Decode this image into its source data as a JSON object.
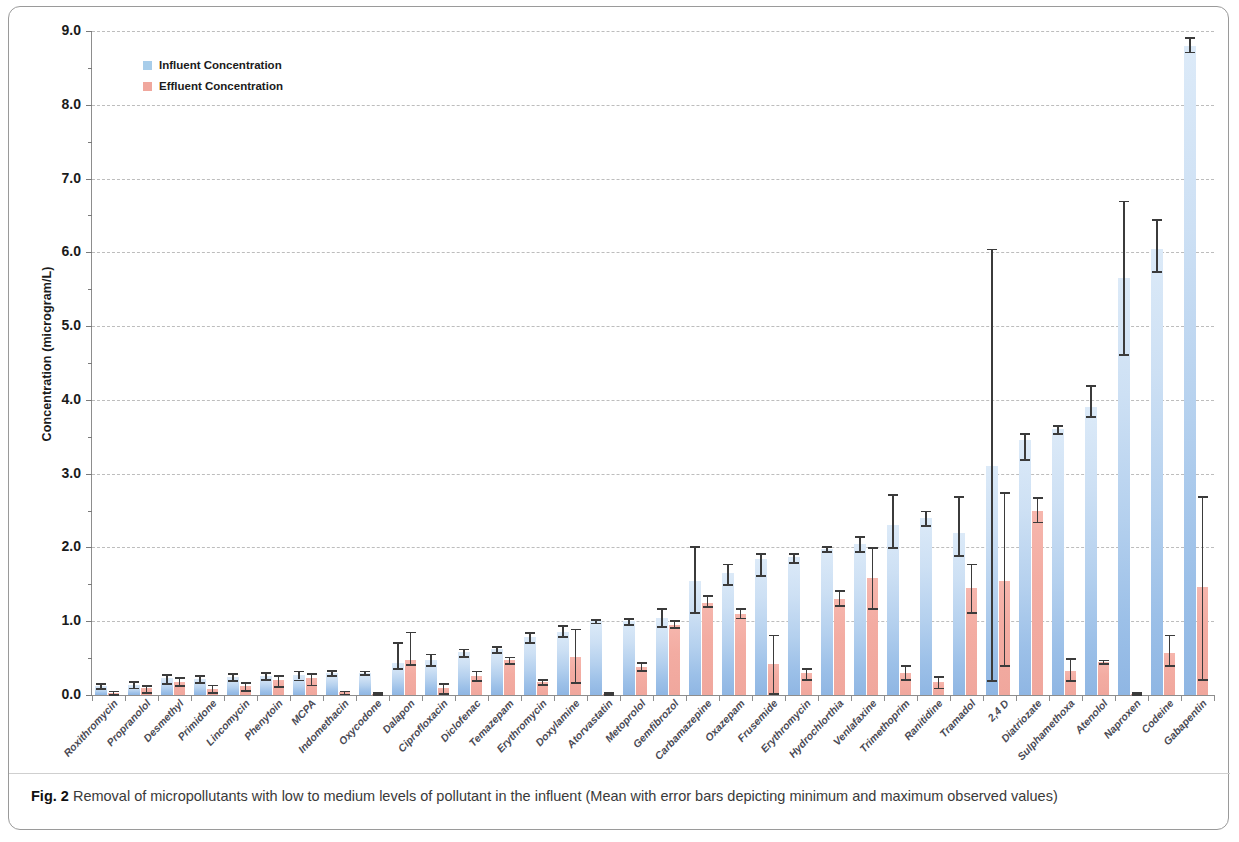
{
  "figure": {
    "caption_label": "Fig. 2",
    "caption_text": "Removal of micropollutants with low to medium levels of pollutant in the influent (Mean with error bars depicting minimum and maximum observed values)"
  },
  "legend": {
    "position": "top-left-inside",
    "items": [
      {
        "label": "Influent Concentration",
        "color": "#a8cdea",
        "key": "influent"
      },
      {
        "label": "Effluent Concentration",
        "color": "#f0a79d",
        "key": "effluent"
      }
    ]
  },
  "chart_data": {
    "type": "bar",
    "title": "",
    "subtitle": "",
    "xlabel": "",
    "ylabel": "Concentration (microgram/L)",
    "ylim": [
      0.0,
      9.0
    ],
    "yticks": [
      "0.0",
      "1.0",
      "2.0",
      "3.0",
      "4.0",
      "5.0",
      "6.0",
      "7.0",
      "8.0",
      "9.0"
    ],
    "ytick_values": [
      0,
      1,
      2,
      3,
      4,
      5,
      6,
      7,
      8,
      9
    ],
    "grid": true,
    "grid_axis": "y",
    "legend_position": "upper left",
    "categories": [
      "Roxithromycin",
      "Propranolol",
      "Desmethyl",
      "Primidone",
      "Lincomycin",
      "Phenytoin",
      "MCPA",
      "Indomethacin",
      "Oxycodone",
      "Dalapon",
      "Ciprofloxacin",
      "Diclofenac",
      "Temazepam",
      "Erythromycin",
      "Doxylamine",
      "Atorvastatin",
      "Metoprolol",
      "Gemfibrozol",
      "Carbamazepine",
      "Oxazepam",
      "Frusemide",
      "Erythromycin",
      "Hydrochlorthia",
      "Venlafaxine",
      "Trimethoprim",
      "Ranitidine",
      "Tramadol",
      "2,4 D",
      "Diatriozate",
      "Sulphamethoxa",
      "Atenolol",
      "Naproxen",
      "Codeine",
      "Gabapentin"
    ],
    "series": [
      {
        "name": "Influent Concentration",
        "color": "#a8cdea",
        "values": [
          0.12,
          0.14,
          0.23,
          0.22,
          0.25,
          0.26,
          0.27,
          0.3,
          0.3,
          0.44,
          0.47,
          0.58,
          0.62,
          0.78,
          0.85,
          1.0,
          1.0,
          1.05,
          1.55,
          1.65,
          1.85,
          1.87,
          1.98,
          2.05,
          2.3,
          2.4,
          2.2,
          3.1,
          3.45,
          3.6,
          3.9,
          5.65,
          6.05,
          8.8
        ],
        "err_low": [
          0.09,
          0.1,
          0.16,
          0.17,
          0.2,
          0.22,
          0.21,
          0.27,
          0.28,
          0.36,
          0.4,
          0.53,
          0.58,
          0.72,
          0.8,
          0.98,
          0.96,
          0.93,
          1.12,
          1.5,
          1.63,
          1.8,
          1.95,
          1.95,
          2.0,
          2.3,
          1.9,
          0.2,
          3.2,
          3.55,
          3.78,
          4.62,
          5.75,
          8.72
        ],
        "err_high": [
          0.16,
          0.19,
          0.28,
          0.27,
          0.3,
          0.31,
          0.33,
          0.34,
          0.33,
          0.72,
          0.56,
          0.63,
          0.66,
          0.85,
          0.95,
          1.03,
          1.04,
          1.18,
          2.02,
          1.78,
          1.92,
          1.92,
          2.02,
          2.15,
          2.72,
          2.5,
          2.7,
          6.05,
          3.55,
          3.66,
          4.2,
          6.7,
          6.45,
          8.92
        ]
      },
      {
        "name": "Effluent Concentration",
        "color": "#f0a79d",
        "values": [
          0.03,
          0.09,
          0.18,
          0.08,
          0.12,
          0.2,
          0.23,
          0.04,
          0.02,
          0.48,
          0.1,
          0.26,
          0.47,
          0.18,
          0.51,
          0.02,
          0.38,
          0.95,
          1.25,
          1.1,
          0.42,
          0.3,
          1.3,
          1.58,
          0.3,
          0.17,
          1.45,
          1.55,
          2.5,
          0.33,
          0.45,
          0.02,
          0.57,
          1.47
        ],
        "err_low": [
          0.01,
          0.04,
          0.13,
          0.04,
          0.07,
          0.12,
          0.14,
          0.02,
          0.01,
          0.42,
          0.03,
          0.2,
          0.43,
          0.15,
          0.18,
          0.01,
          0.34,
          0.92,
          1.2,
          1.05,
          0.03,
          0.22,
          1.22,
          1.18,
          0.22,
          0.1,
          1.12,
          0.4,
          2.35,
          0.2,
          0.43,
          0.01,
          0.4,
          0.22
        ],
        "err_high": [
          0.06,
          0.13,
          0.24,
          0.14,
          0.17,
          0.27,
          0.3,
          0.06,
          0.04,
          0.86,
          0.16,
          0.33,
          0.52,
          0.22,
          0.9,
          0.04,
          0.45,
          1.02,
          1.35,
          1.18,
          0.82,
          0.36,
          1.42,
          2.0,
          0.4,
          0.26,
          1.78,
          2.75,
          2.68,
          0.5,
          0.48,
          0.04,
          0.82,
          2.7
        ]
      }
    ]
  }
}
